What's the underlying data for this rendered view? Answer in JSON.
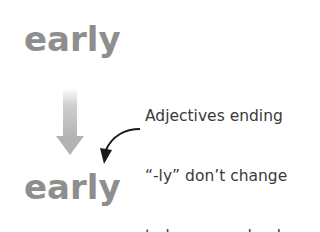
{
  "diagram": {
    "word_before": "early",
    "word_after": "early",
    "annotation_lines": [
      "Adjectives ending",
      "“-ly” don’t change",
      "to become adverbs."
    ],
    "colors": {
      "word": "#8e8e8e",
      "down_arrow": "#b3b3b3",
      "annotation_text": "#3a3a3a",
      "curved_arrow": "#1a1a1a"
    },
    "icons": {
      "down_arrow": "gradient-down-arrow",
      "pointer_arrow": "curved-pointer-arrow"
    }
  }
}
